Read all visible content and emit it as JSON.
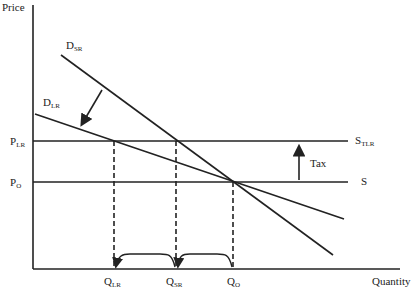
{
  "diagram": {
    "axis": {
      "y_label": "Price",
      "x_label": "Quantity"
    },
    "curves": [
      {
        "name": "D",
        "sub": "SR"
      },
      {
        "name": "D",
        "sub": "LR"
      },
      {
        "name": "S",
        "sub": "TLR"
      },
      {
        "name": "S",
        "sub": ""
      }
    ],
    "price_labels": [
      {
        "name": "P",
        "sub": "LR"
      },
      {
        "name": "P",
        "sub": "O"
      }
    ],
    "quantity_labels": [
      {
        "name": "Q",
        "sub": "LR"
      },
      {
        "name": "Q",
        "sub": "SR"
      },
      {
        "name": "Q",
        "sub": "O"
      }
    ],
    "tax_label": "Tax",
    "colors": {
      "line": "#222222",
      "background": "#ffffff"
    }
  }
}
